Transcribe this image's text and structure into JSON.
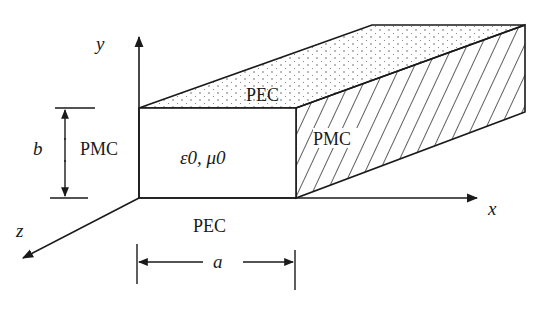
{
  "diagram": {
    "type": "parallel-plate waveguide cross-section (3D box)",
    "axes": {
      "x_label": "x",
      "y_label": "y",
      "z_label": "z"
    },
    "dimensions": {
      "height_label": "b",
      "width_label": "a"
    },
    "walls": {
      "top": "PEC",
      "bottom": "PEC",
      "left": "PMC",
      "right": "PMC"
    },
    "medium": "ε0, μ0",
    "colors": {
      "stroke": "#1a1a1a",
      "background": "#ffffff"
    }
  }
}
